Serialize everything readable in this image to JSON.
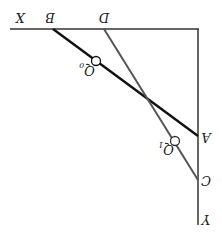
{
  "diagram": {
    "orientation": "rotated 180 degrees",
    "axes": {
      "x_label": "X",
      "y_label": "Y"
    },
    "points": {
      "A": "A",
      "B": "B",
      "C": "C",
      "D": "D"
    },
    "markers": {
      "q0": {
        "base": "Q",
        "sub": "0"
      },
      "q1": {
        "base": "Q",
        "sub": "1"
      }
    },
    "colors": {
      "line_ba": "#111111",
      "line_dc": "#555555",
      "axis": "#333333"
    }
  }
}
